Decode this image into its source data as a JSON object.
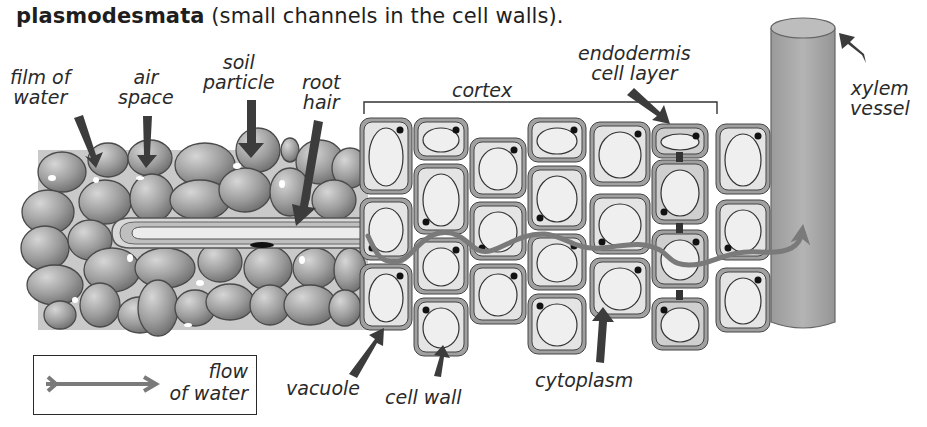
{
  "caption": {
    "bold": "plasmodesmata",
    "rest": " (small channels in the cell walls)."
  },
  "labels": {
    "film_of_water": [
      "film of",
      "water"
    ],
    "air_space": [
      "air",
      "space"
    ],
    "soil_particle": [
      "soil",
      "particle"
    ],
    "root_hair": [
      "root",
      "hair"
    ],
    "cortex": "cortex",
    "endodermis": [
      "endodermis",
      "cell layer"
    ],
    "xylem_vessel": [
      "xylem",
      "vessel"
    ],
    "vacuole": "vacuole",
    "cell_wall": "cell wall",
    "cytoplasm": "cytoplasm"
  },
  "legend": {
    "line1": "flow",
    "line2": "of water",
    "icon": "arrow-right-icon"
  },
  "colors": {
    "soil_band": "#c8c8c8",
    "soil_particle": "#9a9a9a",
    "cell_wall": "#a0a0a0",
    "cytoplasm": "#e4e4e4",
    "endodermis_cytoplasm": "#cfcfcf",
    "flow_arrow": "#7a7a7a",
    "label_arrow": "#3c3c3c",
    "xylem": "#a8a8a8",
    "casparian_strip": "#3a3a3a"
  }
}
